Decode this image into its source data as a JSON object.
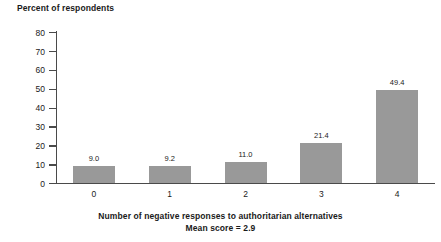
{
  "chart_data": {
    "type": "bar",
    "title": "Percent of respondents",
    "xlabel": "Number of negative responses to authoritarian alternatives",
    "ylabel": "Percent of respondents",
    "note": "Mean score = 2.9",
    "categories": [
      "0",
      "1",
      "2",
      "3",
      "4"
    ],
    "values": [
      9.0,
      9.2,
      11.0,
      21.4,
      49.4
    ],
    "value_labels": [
      "9.0",
      "9.2",
      "11.0",
      "21.4",
      "49.4"
    ],
    "ylim": [
      0,
      80
    ],
    "yticks": [
      80,
      70,
      60,
      50,
      40,
      30,
      20,
      10,
      0
    ],
    "ytick_labels": [
      "80",
      "70",
      "60",
      "50",
      "40",
      "30",
      "20",
      "10",
      "0"
    ],
    "grid": false,
    "legend": null,
    "bar_color": "#999999",
    "axis_color": "#4a4a4a",
    "text_color": "#1a1a1a"
  }
}
